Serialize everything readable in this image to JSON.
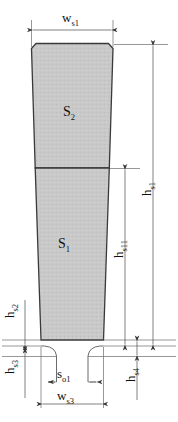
{
  "diagram": {
    "type": "engineering-dimension-drawing",
    "fill_color": "#c9c9c9",
    "line_color": "#3a3a3a",
    "dim_color": "#4a4a4a",
    "background": "#ffffff"
  },
  "areas": [
    {
      "id": "S2",
      "base": "S",
      "sub": "2",
      "description": "upper slot region"
    },
    {
      "id": "S1",
      "base": "S",
      "sub": "1",
      "description": "lower slot region"
    }
  ],
  "dimensions": [
    {
      "id": "ws1",
      "base": "w",
      "sub": "s1",
      "orientation": "horizontal",
      "position": "top",
      "description": "slot top width"
    },
    {
      "id": "hs1",
      "base": "h",
      "sub": "s1",
      "orientation": "vertical",
      "position": "right-outer",
      "description": "total slot height"
    },
    {
      "id": "hs11",
      "base": "h",
      "sub": "s11",
      "orientation": "vertical",
      "position": "right-inner",
      "description": "lower region height"
    },
    {
      "id": "hs2",
      "base": "h",
      "sub": "s2",
      "orientation": "vertical",
      "position": "left-upper",
      "description": "wedge height"
    },
    {
      "id": "hs3",
      "base": "h",
      "sub": "s3",
      "orientation": "vertical",
      "position": "left-lower",
      "description": "slot neck height"
    },
    {
      "id": "hs4",
      "base": "h",
      "sub": "s4",
      "orientation": "vertical",
      "position": "right-bottom",
      "description": "tooth tip height"
    },
    {
      "id": "so1",
      "base": "s",
      "sub": "o1",
      "orientation": "horizontal",
      "position": "bottom-inner",
      "description": "slot opening width"
    },
    {
      "id": "ws3",
      "base": "w",
      "sub": "s3",
      "orientation": "horizontal",
      "position": "bottom",
      "description": "slot bottom width"
    }
  ]
}
